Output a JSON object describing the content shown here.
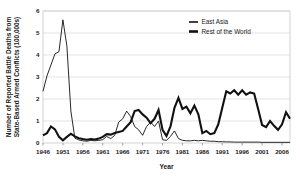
{
  "chart_data": {
    "type": "line",
    "title": "",
    "xlabel": "Year",
    "ylabel": "Number of Reported Battle Deaths from State-Based Armed Conflicts (100,000s)",
    "ylabel_lines": [
      "Number of Reported Battle Deaths from",
      "State-Based Armed Conflicts (100,000s)"
    ],
    "xlim": [
      1946,
      2008
    ],
    "ylim": [
      0,
      6
    ],
    "y_ticks": [
      0,
      1,
      2,
      3,
      4,
      5,
      6
    ],
    "y_tick_labels": [
      "0",
      "1",
      "2",
      "3",
      "4",
      "5",
      "6"
    ],
    "x_ticks": [
      1946,
      1951,
      1956,
      1961,
      1966,
      1971,
      1976,
      1981,
      1986,
      1991,
      1996,
      2001,
      2006
    ],
    "x_tick_labels": [
      "1946",
      "1951",
      "1956",
      "1961",
      "1966",
      "1971",
      "1976",
      "1981",
      "1986",
      "1991",
      "1996",
      "2001",
      "2006"
    ],
    "grid": true,
    "grid_axis": "y",
    "legend_position": "top-right",
    "x": [
      1946,
      1947,
      1948,
      1949,
      1950,
      1951,
      1952,
      1953,
      1954,
      1955,
      1956,
      1957,
      1958,
      1959,
      1960,
      1961,
      1962,
      1963,
      1964,
      1965,
      1966,
      1967,
      1968,
      1969,
      1970,
      1971,
      1972,
      1973,
      1974,
      1975,
      1976,
      1977,
      1978,
      1979,
      1980,
      1981,
      1982,
      1983,
      1984,
      1985,
      1986,
      1987,
      1988,
      1989,
      1990,
      1991,
      1992,
      1993,
      1994,
      1995,
      1996,
      1997,
      1998,
      1999,
      2000,
      2001,
      2002,
      2003,
      2004,
      2005,
      2006,
      2007,
      2008
    ],
    "series": [
      {
        "name": "East Asia",
        "color": "#111111",
        "line_width": 0.9,
        "values": [
          2.35,
          3.05,
          3.55,
          4.05,
          4.15,
          5.6,
          4.4,
          1.45,
          0.22,
          0.14,
          0.1,
          0.08,
          0.12,
          0.1,
          0.12,
          0.15,
          0.3,
          0.2,
          0.35,
          0.95,
          1.1,
          1.45,
          1.2,
          0.75,
          0.6,
          0.35,
          0.75,
          0.95,
          0.75,
          1.0,
          0.15,
          0.12,
          0.3,
          0.55,
          0.2,
          0.12,
          0.1,
          0.1,
          0.12,
          0.1,
          0.12,
          0.1,
          0.08,
          0.08,
          0.06,
          0.06,
          0.05,
          0.05,
          0.04,
          0.04,
          0.04,
          0.04,
          0.04,
          0.04,
          0.04,
          0.03,
          0.03,
          0.03,
          0.03,
          0.03,
          0.03,
          0.03,
          0.03
        ]
      },
      {
        "name": "Rest of the World",
        "color": "#111111",
        "line_width": 2.1,
        "values": [
          0.35,
          0.45,
          0.75,
          0.62,
          0.28,
          0.12,
          0.28,
          0.42,
          0.3,
          0.22,
          0.18,
          0.15,
          0.18,
          0.16,
          0.2,
          0.28,
          0.4,
          0.38,
          0.45,
          0.5,
          0.55,
          0.75,
          0.95,
          1.45,
          1.5,
          1.3,
          1.15,
          0.9,
          1.1,
          1.5,
          0.6,
          0.32,
          0.75,
          1.6,
          2.05,
          1.55,
          1.65,
          1.35,
          1.7,
          1.3,
          0.45,
          0.55,
          0.4,
          0.45,
          0.85,
          1.6,
          2.35,
          2.25,
          2.4,
          2.2,
          2.4,
          2.2,
          2.3,
          2.25,
          1.55,
          0.82,
          0.72,
          1.0,
          0.78,
          0.6,
          0.85,
          1.4,
          1.1
        ]
      }
    ],
    "legend_items": [
      {
        "label": "East Asia",
        "line_width": 1.6
      },
      {
        "label": "Rest of the World",
        "line_width": 2.6
      }
    ]
  },
  "layout": {
    "plot": {
      "left": 43,
      "top": 11,
      "right": 290,
      "bottom": 143
    },
    "legend": {
      "x": 189,
      "y": 22,
      "swatch_w": 9,
      "row_h": 9.5
    },
    "colors": {
      "line": "#111111",
      "grid": "#d9d9d9",
      "frame": "#c8c8c8",
      "text": "#1a1a1a",
      "background": "#ffffff"
    }
  }
}
